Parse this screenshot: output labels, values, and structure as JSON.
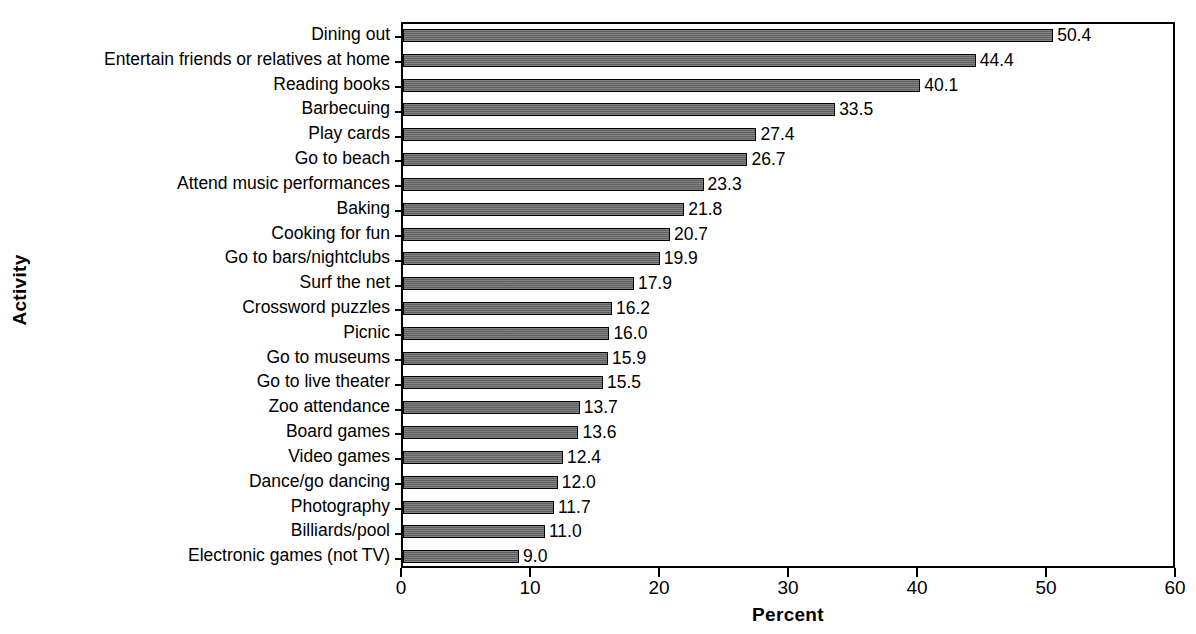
{
  "chart_data": {
    "type": "bar",
    "orientation": "horizontal",
    "title": "",
    "xlabel": "Percent",
    "ylabel": "Activity",
    "xlim": [
      0,
      60
    ],
    "xticks": [
      0,
      10,
      20,
      30,
      40,
      50,
      60
    ],
    "xtick_labels": [
      "0",
      "10",
      "20",
      "30",
      "40",
      "50",
      "60"
    ],
    "grid": false,
    "legend": null,
    "bar_color": "#6b6b6b",
    "bar_edge_color": "#000000",
    "categories": [
      "Dining out",
      "Entertain friends or relatives at home",
      "Reading books",
      "Barbecuing",
      "Play cards",
      "Go to beach",
      "Attend music performances",
      "Baking",
      "Cooking for fun",
      "Go to bars/nightclubs",
      "Surf the net",
      "Crossword puzzles",
      "Picnic",
      "Go to museums",
      "Go to live theater",
      "Zoo attendance",
      "Board games",
      "Video games",
      "Dance/go dancing",
      "Photography",
      "Billiards/pool",
      "Electronic games (not TV)"
    ],
    "values": [
      50.4,
      44.4,
      40.1,
      33.5,
      27.4,
      26.7,
      23.3,
      21.8,
      20.7,
      19.9,
      17.9,
      16.2,
      16.0,
      15.9,
      15.5,
      13.7,
      13.6,
      12.4,
      12.0,
      11.7,
      11.0,
      9.0
    ],
    "value_labels": [
      "50.4",
      "44.4",
      "40.1",
      "33.5",
      "27.4",
      "26.7",
      "23.3",
      "21.8",
      "20.7",
      "19.9",
      "17.9",
      "16.2",
      "16.0",
      "15.9",
      "15.5",
      "13.7",
      "13.6",
      "12.4",
      "12.0",
      "11.7",
      "11.0",
      "9.0"
    ]
  }
}
